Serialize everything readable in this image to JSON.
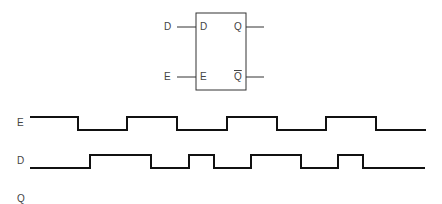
{
  "flipflop": {
    "title": "D latch",
    "outer_inputs": {
      "d": "D",
      "e": "E"
    },
    "inner_pins": {
      "d": "D",
      "e": "E",
      "q": "Q",
      "qbar": "Q"
    },
    "box": {
      "x": 196,
      "y": 13,
      "w": 50,
      "h": 77
    },
    "pin_y": {
      "top": 27,
      "bottom": 77
    }
  },
  "timing": {
    "rows": [
      {
        "label": "E",
        "high_y": 117,
        "low_y": 130,
        "start_level": 1,
        "x_start": 30,
        "x_end": 426,
        "transitions": [
          78,
          127,
          177,
          227,
          277,
          326,
          376
        ]
      },
      {
        "label": "D",
        "high_y": 155,
        "low_y": 168,
        "start_level": 0,
        "x_start": 30,
        "x_end": 425,
        "transitions": [
          90,
          151,
          189,
          214,
          251,
          301,
          338,
          363
        ]
      },
      {
        "label": "Q",
        "waveform": "blank"
      }
    ]
  },
  "colors": {
    "line": "#111111",
    "text": "#444444",
    "background": "#ffffff"
  }
}
